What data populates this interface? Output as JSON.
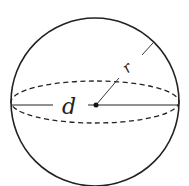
{
  "diagram": {
    "labels": {
      "diameter": "d",
      "radius": "r"
    },
    "colors": {
      "stroke": "#222222",
      "background": "#ffffff"
    }
  }
}
